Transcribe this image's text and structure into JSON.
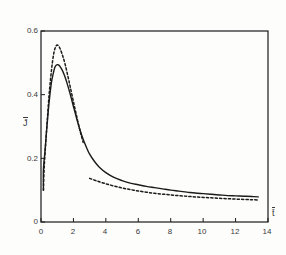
{
  "chart_data": {
    "type": "line",
    "title": "",
    "subtitle": "",
    "xlabel": "t̄",
    "ylabel": "J̄",
    "xlim": [
      0,
      14
    ],
    "ylim": [
      0,
      0.6
    ],
    "xticks": [
      "0",
      "2",
      "4",
      "6",
      "8",
      "10",
      "12",
      "14"
    ],
    "xtick_values": [
      0,
      2,
      4,
      6,
      8,
      10,
      12,
      14
    ],
    "yticks": [
      "0",
      "0.2",
      "0.4",
      "0.6"
    ],
    "ytick_values": [
      0,
      0.2,
      0.4,
      0.6
    ],
    "grid": false,
    "legend": null,
    "series": [
      {
        "name": "solid-curve",
        "style": "solid",
        "color": "#1a1a1a",
        "x": [
          0.15,
          0.15,
          0.25,
          0.35,
          0.45,
          0.55,
          0.65,
          0.75,
          0.85,
          0.95,
          1.05,
          1.15,
          1.3,
          1.45,
          1.6,
          1.8,
          2.0,
          2.2,
          2.4,
          2.6,
          2.8,
          3.0,
          3.3,
          3.6,
          4.0,
          4.5,
          5.0,
          5.5,
          6.0,
          6.5,
          7.0,
          7.5,
          8.0,
          8.5,
          9.0,
          9.5,
          10.0,
          10.5,
          11.0,
          11.5,
          12.0,
          12.5,
          13.0,
          13.4
        ],
        "y": [
          0.1,
          0.165,
          0.225,
          0.29,
          0.35,
          0.4,
          0.44,
          0.465,
          0.485,
          0.493,
          0.494,
          0.49,
          0.478,
          0.46,
          0.437,
          0.402,
          0.363,
          0.325,
          0.29,
          0.26,
          0.235,
          0.213,
          0.19,
          0.172,
          0.155,
          0.14,
          0.13,
          0.122,
          0.117,
          0.112,
          0.108,
          0.104,
          0.1,
          0.097,
          0.094,
          0.091,
          0.089,
          0.087,
          0.085,
          0.083,
          0.082,
          0.081,
          0.08,
          0.079
        ]
      },
      {
        "name": "dashed-curve-rise",
        "style": "dashed",
        "color": "#1a1a1a",
        "x": [
          0.15,
          0.2,
          0.3,
          0.4,
          0.5,
          0.6,
          0.7,
          0.8,
          0.9,
          1.0,
          1.1,
          1.2,
          1.35,
          1.5,
          1.65,
          1.8,
          2.0,
          2.2,
          2.4,
          2.6
        ],
        "y": [
          0.1,
          0.175,
          0.255,
          0.33,
          0.4,
          0.455,
          0.5,
          0.533,
          0.55,
          0.556,
          0.552,
          0.542,
          0.52,
          0.493,
          0.46,
          0.425,
          0.378,
          0.332,
          0.288,
          0.25
        ]
      },
      {
        "name": "dashed-curve-tail",
        "style": "dashed",
        "color": "#1a1a1a",
        "x": [
          3.0,
          3.5,
          4.0,
          4.5,
          5.0,
          5.5,
          6.0,
          6.5,
          7.0,
          7.5,
          8.0,
          8.5,
          9.0,
          9.5,
          10.0,
          10.5,
          11.0,
          11.5,
          12.0,
          12.5,
          13.0,
          13.4
        ],
        "y": [
          0.137,
          0.128,
          0.12,
          0.113,
          0.107,
          0.102,
          0.0975,
          0.0935,
          0.0903,
          0.0875,
          0.085,
          0.0827,
          0.0807,
          0.0789,
          0.0773,
          0.0758,
          0.0744,
          0.0731,
          0.072,
          0.0709,
          0.0699,
          0.0692
        ]
      }
    ],
    "axis_color": "#1a1a1a",
    "background": "#fdfdfc"
  }
}
